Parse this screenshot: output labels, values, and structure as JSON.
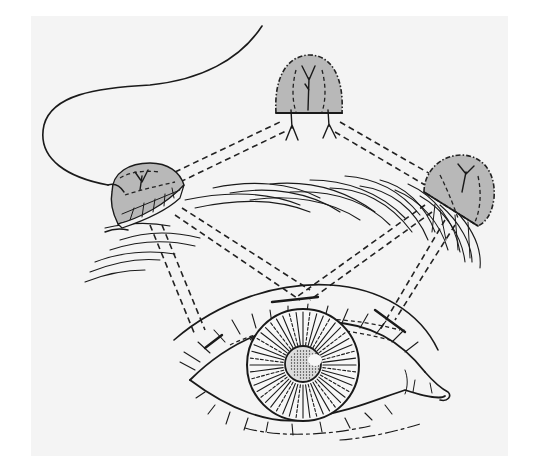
{
  "figure": {
    "type": "medical-illustration",
    "colors": {
      "page_background": "#ffffff",
      "panel_background": "#f4f4f4",
      "ink": "#1a1a1a",
      "graft_fill": "#b8b8b8",
      "graft_cell_fill": "#f2f2f2"
    },
    "panel": {
      "x": 31,
      "y": 16,
      "width": 477,
      "height": 440
    },
    "elements": {
      "nose_outline": "nasal profile curve ending at left graft",
      "graft_left": "medial graft with exposed cellular cross-section",
      "graft_top": "superior graft with branching vessels",
      "graft_right": "lateral graft overlying brow hairs",
      "eyebrow": "curved hair strokes",
      "eye": "eyelids, lashes, iris with radial striations, stippled pupil, caruncle",
      "connection_lines": "paired dashed lines linking grafts to each other and to the eye"
    },
    "iris": {
      "cx": 303,
      "cy": 365,
      "r": 56
    },
    "pupil": {
      "cx": 303,
      "cy": 364,
      "r": 18
    }
  }
}
